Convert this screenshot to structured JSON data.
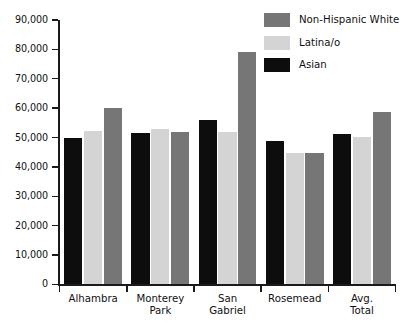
{
  "chart_data": {
    "type": "bar",
    "title": "",
    "subtitle": "",
    "xlabel": "",
    "ylabel": "",
    "ylim": [
      0,
      90000
    ],
    "ytick_step": 10000,
    "ytick_labels": [
      "90,000",
      "80,000",
      "70,000",
      "60,000",
      "50,000",
      "40,000",
      "30,000",
      "20,000",
      "10,000",
      "0"
    ],
    "ytick_values": [
      90000,
      80000,
      70000,
      60000,
      50000,
      40000,
      30000,
      20000,
      10000,
      0
    ],
    "grid": false,
    "legend_position": "top-right",
    "categories": [
      "Alhambra",
      "Monterey\nPark",
      "San\nGabriel",
      "Rosemead",
      "Avg.\nTotal"
    ],
    "category_labels_flat": [
      "Alhambra",
      "Monterey Park",
      "San Gabriel",
      "Rosemead",
      "Avg. Total"
    ],
    "series_draw_order": [
      "Asian",
      "Latina/o",
      "Non-Hispanic White"
    ],
    "legend_order": [
      "Non-Hispanic White",
      "Latina/o",
      "Asian"
    ],
    "series": [
      {
        "name": "Asian",
        "color": "#0d0d0d",
        "values": [
          50000,
          51500,
          55800,
          48900,
          51300
        ]
      },
      {
        "name": "Latina/o",
        "color": "#d4d4d4",
        "values": [
          52300,
          52900,
          52000,
          44700,
          50200
        ]
      },
      {
        "name": "Non-Hispanic White",
        "color": "#767676",
        "values": [
          60200,
          51800,
          79200,
          44800,
          58800
        ]
      }
    ]
  },
  "legend": {
    "items": [
      {
        "label": "Non-Hispanic White",
        "swatch_class": "nhwhite"
      },
      {
        "label": "Latina/o",
        "swatch_class": "latina"
      },
      {
        "label": "Asian",
        "swatch_class": "asian"
      }
    ]
  },
  "colors": {
    "asian": "#0d0d0d",
    "latina": "#d4d4d4",
    "non_hispanic_white": "#767676",
    "axis": "#1a1a1a",
    "background": "#ffffff",
    "text": "#111111"
  }
}
